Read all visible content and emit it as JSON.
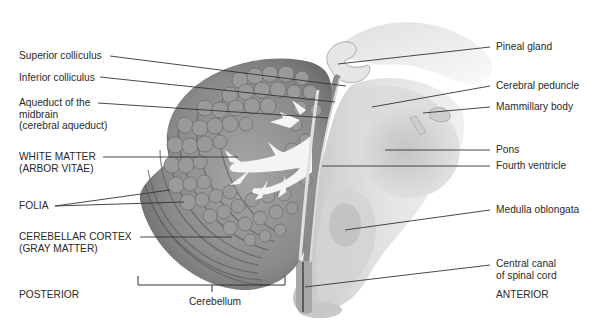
{
  "diagram": {
    "orientation": {
      "left": "POSTERIOR",
      "right": "ANTERIOR"
    },
    "bracket_label": "Cerebellum",
    "left_labels": [
      {
        "id": "superior-colliculus",
        "lines": [
          "Superior colliculus"
        ]
      },
      {
        "id": "inferior-colliculus",
        "lines": [
          "Inferior colliculus"
        ]
      },
      {
        "id": "aqueduct-of-midbrain",
        "lines": [
          "Aqueduct of the",
          "midbrain",
          "(cerebral aqueduct)"
        ]
      },
      {
        "id": "white-matter",
        "lines": [
          "WHITE MATTER",
          "(ARBOR VITAE)"
        ]
      },
      {
        "id": "folia",
        "lines": [
          "FOLIA"
        ]
      },
      {
        "id": "cerebellar-cortex",
        "lines": [
          "CEREBELLAR CORTEX",
          "(GRAY MATTER)"
        ]
      }
    ],
    "right_labels": [
      {
        "id": "pineal-gland",
        "lines": [
          "Pineal gland"
        ]
      },
      {
        "id": "cerebral-peduncle",
        "lines": [
          "Cerebral peduncle"
        ]
      },
      {
        "id": "mammillary-body",
        "lines": [
          "Mammillary body"
        ]
      },
      {
        "id": "pons",
        "lines": [
          "Pons"
        ]
      },
      {
        "id": "fourth-ventricle",
        "lines": [
          "Fourth ventricle"
        ]
      },
      {
        "id": "medulla-oblongata",
        "lines": [
          "Medulla oblongata"
        ]
      },
      {
        "id": "central-canal",
        "lines": [
          "Central canal",
          "of spinal cord"
        ]
      }
    ],
    "colors": {
      "background": "#ffffff",
      "cortex_gray": "#8c8c8c",
      "cortex_dark": "#6e6e6e",
      "lobule_light": "#a3a3a3",
      "white_matter": "#f4f4f4",
      "brainstem": "#d9d9d9",
      "brainstem_dark": "#b5b5b5",
      "leader_line": "#333333",
      "text": "#2a2a2a"
    }
  }
}
